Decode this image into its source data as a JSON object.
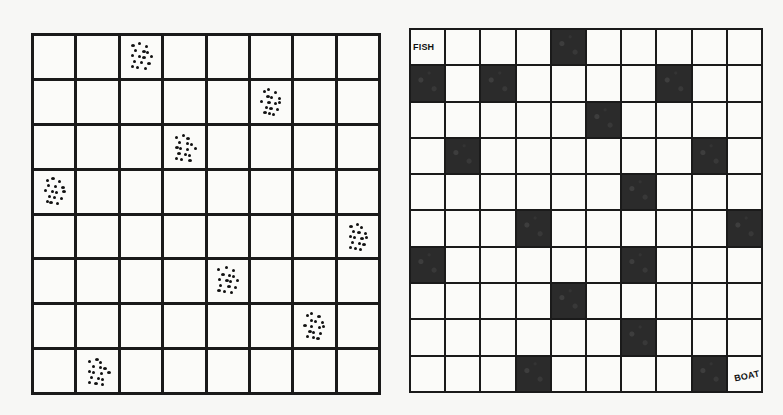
{
  "figures": [
    {
      "id": "queens",
      "description": "8x8 grid with dot clusters marking one cell per row and column",
      "rows": 8,
      "cols": 8,
      "marked_cells": [
        {
          "row": 0,
          "col": 2
        },
        {
          "row": 1,
          "col": 5
        },
        {
          "row": 2,
          "col": 3
        },
        {
          "row": 3,
          "col": 0
        },
        {
          "row": 4,
          "col": 7
        },
        {
          "row": 5,
          "col": 4
        },
        {
          "row": 6,
          "col": 6
        },
        {
          "row": 7,
          "col": 1
        }
      ],
      "marker_icon": "dot-cluster-icon"
    },
    {
      "id": "maze",
      "description": "10x10 grid with black blocked cells; path from FISH to BOAT",
      "rows": 10,
      "cols": 10,
      "blocked_cells": [
        {
          "row": 0,
          "col": 4
        },
        {
          "row": 1,
          "col": 0
        },
        {
          "row": 1,
          "col": 2
        },
        {
          "row": 1,
          "col": 7
        },
        {
          "row": 2,
          "col": 5
        },
        {
          "row": 3,
          "col": 1
        },
        {
          "row": 3,
          "col": 8
        },
        {
          "row": 4,
          "col": 6
        },
        {
          "row": 5,
          "col": 3
        },
        {
          "row": 5,
          "col": 9
        },
        {
          "row": 6,
          "col": 0
        },
        {
          "row": 6,
          "col": 6
        },
        {
          "row": 7,
          "col": 4
        },
        {
          "row": 8,
          "col": 6
        },
        {
          "row": 9,
          "col": 3
        },
        {
          "row": 9,
          "col": 8
        }
      ],
      "labels": {
        "start": {
          "text": "FISH",
          "row": 0,
          "col": 0
        },
        "end": {
          "text": "BOAT",
          "row": 9,
          "col": 9
        }
      }
    }
  ],
  "colors": {
    "background": "#f7f7f5",
    "grid_line": "#1a1a1a",
    "cell": "#fbfbf9",
    "blocked": "#2b2b2b",
    "dot": "#111111"
  }
}
